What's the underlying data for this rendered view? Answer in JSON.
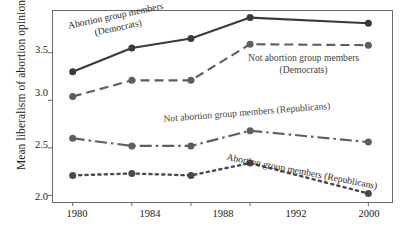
{
  "chart_data": {
    "type": "line",
    "title": "",
    "xlabel": "",
    "ylabel": "Mean liberalism of abortion opinion",
    "categories": [
      "1980",
      "1984",
      "1988",
      "1992",
      "2000"
    ],
    "x_values": [
      1980,
      1984,
      1988,
      1992,
      2000
    ],
    "xlim": [
      1978.6,
      2001.6
    ],
    "ylim": [
      1.93,
      3.95
    ],
    "yticks": [
      2.0,
      2.5,
      3.0,
      3.5
    ],
    "ytick_labels": [
      "2.0",
      "2.5",
      "3.0",
      "3.5"
    ],
    "xtick_labels": [
      "1980",
      "1984",
      "1988",
      "1992",
      "2000"
    ],
    "grid": false,
    "legend_position": "inline-annotations",
    "series": [
      {
        "name": "Abortion group members (Democrats)",
        "style": "solid",
        "color": "#3a3a3a",
        "marker": "circle",
        "values": [
          3.3,
          3.55,
          3.65,
          3.87,
          3.81
        ]
      },
      {
        "name": "Not abortion group members (Democrats)",
        "style": "dashed",
        "color": "#5e5e5e",
        "marker": "circle",
        "values": [
          3.04,
          3.21,
          3.21,
          3.59,
          3.58
        ]
      },
      {
        "name": "Not abortion group members (Republicans)",
        "style": "dash-dot",
        "color": "#5e5e5e",
        "marker": "circle",
        "values": [
          2.6,
          2.52,
          2.52,
          2.68,
          2.56
        ]
      },
      {
        "name": "Abortion group members (Republicans)",
        "style": "dotted",
        "color": "#4a4a4a",
        "marker": "circle",
        "values": [
          2.21,
          2.23,
          2.21,
          2.34,
          2.02
        ]
      }
    ],
    "annotations": [
      {
        "id": "ann-abortion-dem",
        "line1": "Abortion group members",
        "line2": "(Democrats)",
        "rotation": -12
      },
      {
        "id": "ann-not-abortion-dem",
        "line1": "Not abortion group members",
        "line2": "(Democrats)",
        "rotation": 0
      },
      {
        "id": "ann-not-abortion-rep",
        "line1": "Not abortion group members (Republicans)",
        "line2": "",
        "rotation": -5
      },
      {
        "id": "ann-abortion-rep",
        "line1": "Abortion group members (Republicans)",
        "line2": "",
        "rotation": 11
      }
    ],
    "axis_color": "#6b6b6b",
    "text_color": "#1a1a1a"
  },
  "axis": {
    "ylabel": "Mean liberalism of abortion opinion",
    "ytick_0": "3.5",
    "ytick_1": "3.0",
    "ytick_2": "2.5",
    "ytick_3": "2.0",
    "xtick_0": "1980",
    "xtick_1": "1984",
    "xtick_2": "1988",
    "xtick_3": "1992",
    "xtick_4": "2000"
  },
  "annotations": {
    "abortion_dem_l1": "Abortion group members",
    "abortion_dem_l2": "(Democrats)",
    "not_abortion_dem_l1": "Not abortion group members",
    "not_abortion_dem_l2": "(Democrats)",
    "not_abortion_rep": "Not abortion group members (Republicans)",
    "abortion_rep": "Abortion group members (Republicans)"
  }
}
